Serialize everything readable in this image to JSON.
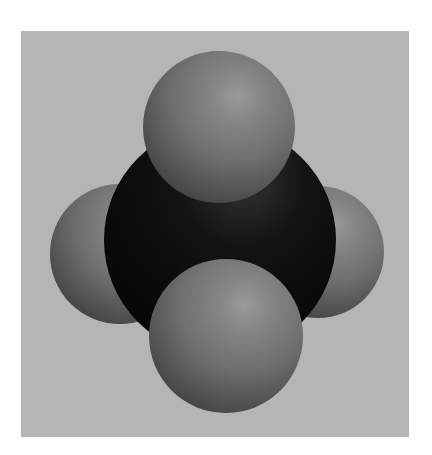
{
  "image": {
    "subject": "space-filling molecular model",
    "background_color": "#ffffff",
    "panel_color": "#b5b5b5",
    "atoms": [
      {
        "role": "left-atom",
        "color": "#6f6f6f",
        "cx": 120,
        "cy": 255,
        "r": 70
      },
      {
        "role": "right-atom",
        "color": "#6f6f6f",
        "cx": 318,
        "cy": 252,
        "r": 66
      },
      {
        "role": "central-atom",
        "color": "#0a0a0a",
        "cx": 220,
        "cy": 240,
        "r": 116
      },
      {
        "role": "top-atom",
        "color": "#7a7a7a",
        "cx": 219,
        "cy": 127,
        "r": 76
      },
      {
        "role": "bottom-atom",
        "color": "#7a7a7a",
        "cx": 226,
        "cy": 336,
        "r": 77
      }
    ]
  }
}
